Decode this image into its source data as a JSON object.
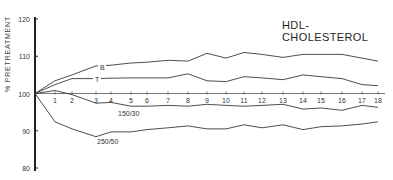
{
  "chart_data": {
    "type": "line",
    "title": "HDL-CHOLESTEROL",
    "xlabel": "",
    "ylabel": "% PRETREATMENT",
    "ylim": [
      80,
      120
    ],
    "yticks": [
      80,
      90,
      100,
      110,
      120
    ],
    "x": [
      0,
      1,
      2,
      3,
      4,
      5,
      6,
      7,
      8,
      9,
      10,
      11,
      12,
      13,
      14,
      15,
      16,
      17,
      18
    ],
    "xtick_labels": [
      "1",
      "2",
      "3",
      "4",
      "5",
      "6",
      "7",
      "8",
      "9",
      "10",
      "11",
      "12",
      "13",
      "14",
      "15",
      "16",
      "17",
      "18"
    ],
    "grid": false,
    "legend_position": "inline labels",
    "series": [
      {
        "name": "B",
        "values": [
          100,
          103.4,
          105,
          107.4,
          107.6,
          108.2,
          108.4,
          108.9,
          108.7,
          110.8,
          109.5,
          111,
          110.5,
          109.7,
          110.5,
          110.5,
          110.5,
          109.5,
          108.7
        ]
      },
      {
        "name": "T",
        "values": [
          100,
          102.4,
          104,
          104,
          104.1,
          104.2,
          104.2,
          104.2,
          105.3,
          103.4,
          103.2,
          104.5,
          104.2,
          103.7,
          105,
          104.5,
          104,
          102.4,
          102.1
        ]
      },
      {
        "name": "150/30",
        "values": [
          100,
          100.8,
          99.7,
          97.4,
          97.6,
          96.6,
          96.6,
          96.8,
          96.6,
          97.1,
          96.8,
          96.6,
          96.8,
          97.1,
          95.8,
          96.1,
          95.5,
          96.8,
          96.3
        ]
      },
      {
        "name": "250/50",
        "values": [
          100,
          92.4,
          90.5,
          88.4,
          89.7,
          89.7,
          90.3,
          90.8,
          91.3,
          90.5,
          90.5,
          91.6,
          90.8,
          91.6,
          90.3,
          91.1,
          91.3,
          91.8,
          92.4
        ]
      }
    ],
    "annotations": [
      {
        "text": "B",
        "series": "B",
        "x": 3.6
      },
      {
        "text": "T",
        "series": "T",
        "x": 3.6
      },
      {
        "text": "150/30",
        "series": "150/30",
        "x": 5.6
      },
      {
        "text": "250/50",
        "series": "250/50",
        "x": 3.6
      }
    ]
  },
  "layout": {
    "x_pixels": [
      35,
      55,
      72,
      96,
      111,
      131,
      147,
      168,
      188,
      207,
      226,
      244,
      262,
      283,
      303,
      321,
      342,
      362,
      378
    ],
    "y_axis_x": 35,
    "y_top_px": 19,
    "y_bottom_px": 168,
    "baseline_end_px": 385,
    "line_color": "#3a3a3a",
    "label_positions": {
      "B": [
        100,
        70
      ],
      "T": [
        95,
        82
      ],
      "150/30": [
        118,
        116
      ],
      "250/50": [
        97,
        144
      ]
    }
  }
}
